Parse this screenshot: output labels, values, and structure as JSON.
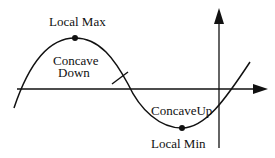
{
  "diagram": {
    "labels": {
      "local_max": "Local Max",
      "concave_down_line1": "Concave",
      "concave_down_line2": "Down",
      "concave_up": "ConcaveUp",
      "local_min": "Local Min"
    },
    "colors": {
      "stroke": "#111111",
      "background": "#ffffff"
    }
  }
}
